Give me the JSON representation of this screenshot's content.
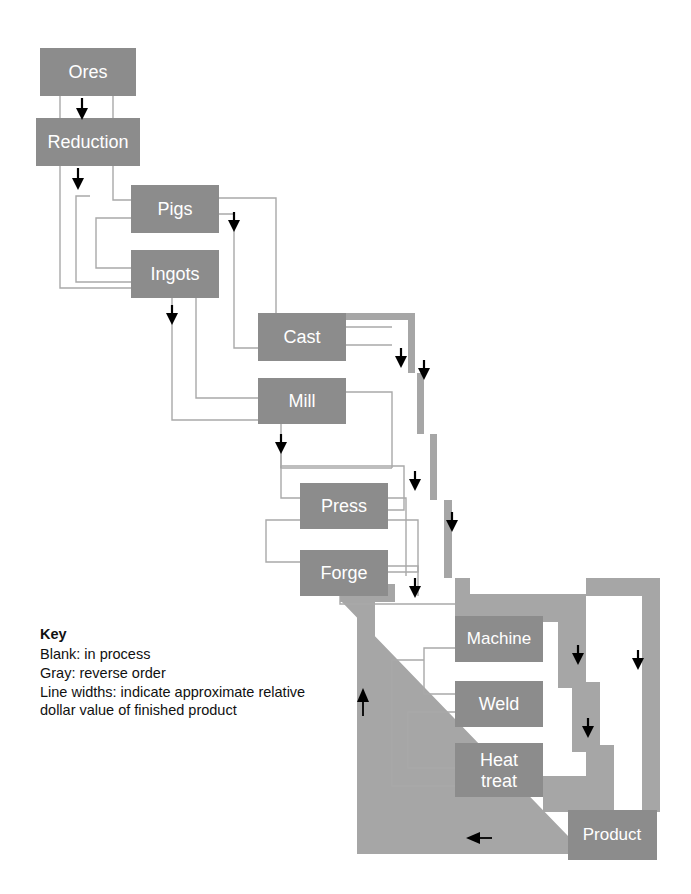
{
  "diagram": {
    "colors": {
      "node_fill": "#8c8c8c",
      "node_text": "#ffffff",
      "thin_line": "#a9a9a9",
      "thick_band": "#a6a6a6",
      "arrow": "#000000",
      "background": "#ffffff"
    },
    "nodes": [
      {
        "id": "ores",
        "label": "Ores",
        "x": 40,
        "y": 48,
        "w": 96,
        "h": 48
      },
      {
        "id": "reduction",
        "label": "Reduction",
        "x": 36,
        "y": 118,
        "w": 104,
        "h": 48
      },
      {
        "id": "pigs",
        "label": "Pigs",
        "x": 131,
        "y": 185,
        "w": 88,
        "h": 48
      },
      {
        "id": "ingots",
        "label": "Ingots",
        "x": 131,
        "y": 250,
        "w": 88,
        "h": 48
      },
      {
        "id": "cast",
        "label": "Cast",
        "x": 258,
        "y": 313,
        "w": 88,
        "h": 48
      },
      {
        "id": "mill",
        "label": "Mill",
        "x": 258,
        "y": 378,
        "w": 88,
        "h": 46
      },
      {
        "id": "press",
        "label": "Press",
        "x": 300,
        "y": 483,
        "w": 88,
        "h": 46
      },
      {
        "id": "forge",
        "label": "Forge",
        "x": 300,
        "y": 550,
        "w": 88,
        "h": 46
      },
      {
        "id": "machine",
        "label": "Machine",
        "x": 455,
        "y": 616,
        "w": 88,
        "h": 46
      },
      {
        "id": "weld",
        "label": "Weld",
        "x": 455,
        "y": 681,
        "w": 88,
        "h": 46
      },
      {
        "id": "heattreat",
        "label": "Heat treat",
        "x": 455,
        "y": 743,
        "w": 88,
        "h": 54
      },
      {
        "id": "product",
        "label": "Product",
        "x": 568,
        "y": 810,
        "w": 89,
        "h": 50
      }
    ],
    "node_labels": {
      "ores": "Ores",
      "reduction": "Reduction",
      "pigs": "Pigs",
      "ingots": "Ingots",
      "cast": "Cast",
      "mill": "Mill",
      "press": "Press",
      "forge": "Forge",
      "machine": "Machine",
      "weld": "Weld",
      "heattreat_line1": "Heat",
      "heattreat_line2": "treat",
      "product": "Product"
    },
    "flow_sequence": [
      "Ores",
      "Reduction",
      "Pigs",
      "Ingots",
      "Cast",
      "Mill",
      "Press",
      "Forge",
      "Machine",
      "Weld",
      "Heat treat",
      "Product"
    ],
    "arrows": [
      {
        "id": "ores-to-reduction",
        "direction": "down",
        "x": 82,
        "y": 98
      },
      {
        "id": "reduction-to-pigs",
        "direction": "down",
        "x": 78,
        "y": 168
      },
      {
        "id": "pigs-to-cast",
        "direction": "down",
        "x": 234,
        "y": 212
      },
      {
        "id": "ingots-to-mill",
        "direction": "down",
        "x": 172,
        "y": 305
      },
      {
        "id": "cast-down-left",
        "direction": "down",
        "x": 401,
        "y": 348
      },
      {
        "id": "cast-down-right",
        "direction": "down",
        "x": 424,
        "y": 360
      },
      {
        "id": "mill-to-press",
        "direction": "down",
        "x": 281,
        "y": 436
      },
      {
        "id": "press-branch",
        "direction": "down",
        "x": 415,
        "y": 471
      },
      {
        "id": "press-branch-right",
        "direction": "down",
        "x": 452,
        "y": 512
      },
      {
        "id": "forge-to-machine",
        "direction": "down",
        "x": 415,
        "y": 578
      },
      {
        "id": "machine-down",
        "direction": "down",
        "x": 578,
        "y": 645
      },
      {
        "id": "machine-down-far-right",
        "direction": "down",
        "x": 638,
        "y": 650
      },
      {
        "id": "weld-down",
        "direction": "down",
        "x": 588,
        "y": 718
      },
      {
        "id": "return-left",
        "direction": "left",
        "x": 470,
        "y": 837
      },
      {
        "id": "return-up",
        "direction": "up",
        "x": 363,
        "y": 700
      }
    ]
  },
  "key": {
    "title": "Key",
    "lines": [
      "Blank: in process",
      "Gray: reverse order",
      "Line widths: indicate approximate relative",
      "dollar value of finished product"
    ],
    "line1": "Blank: in process",
    "line2": "Gray: reverse order",
    "line3": "Line widths: indicate approximate relative",
    "line4": "dollar value of finished product"
  }
}
